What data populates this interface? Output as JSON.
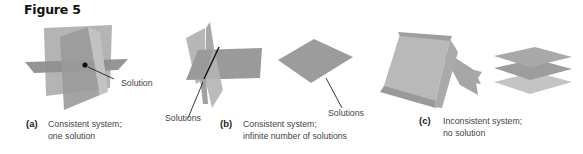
{
  "figure": {
    "title": "Figure 5"
  },
  "panels": [
    {
      "letter": "(a)",
      "caption_line1": "Consistent system;",
      "caption_line2": "one solution",
      "annotations": [
        "Solution"
      ]
    },
    {
      "letter": "(b)",
      "caption_line1": "Consistent system;",
      "caption_line2": "infinite number of solutions",
      "annotations": [
        "Solutions",
        "Solutions"
      ]
    },
    {
      "letter": "(c)",
      "caption_line1": "Inconsistent system;",
      "caption_line2": "no solution",
      "annotations": []
    }
  ],
  "colors": {
    "plane_light": "#b9b9b9",
    "plane_mid": "#a2a2a2",
    "plane_dark": "#8e8e8e",
    "line": "#111111"
  }
}
